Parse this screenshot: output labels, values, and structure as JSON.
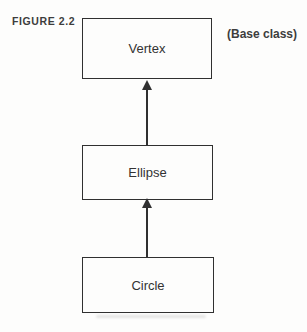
{
  "figure": {
    "label": "FIGURE 2.2",
    "annotation": "(Base class)"
  },
  "diagram": {
    "type": "class-hierarchy",
    "nodes": [
      {
        "id": "vertex",
        "label": "Vertex",
        "note": "base class"
      },
      {
        "id": "ellipse",
        "label": "Ellipse",
        "note": "derives from Vertex"
      },
      {
        "id": "circle",
        "label": "Circle",
        "note": "derives from Ellipse"
      }
    ],
    "edges": [
      {
        "from": "ellipse",
        "to": "vertex",
        "style": "solid",
        "arrowhead": "up"
      },
      {
        "from": "circle",
        "to": "ellipse",
        "style": "solid",
        "arrowhead": "up"
      }
    ]
  },
  "colors": {
    "ink": "#303030",
    "text": "#3d3d3d",
    "background": "#fdfdfc"
  }
}
